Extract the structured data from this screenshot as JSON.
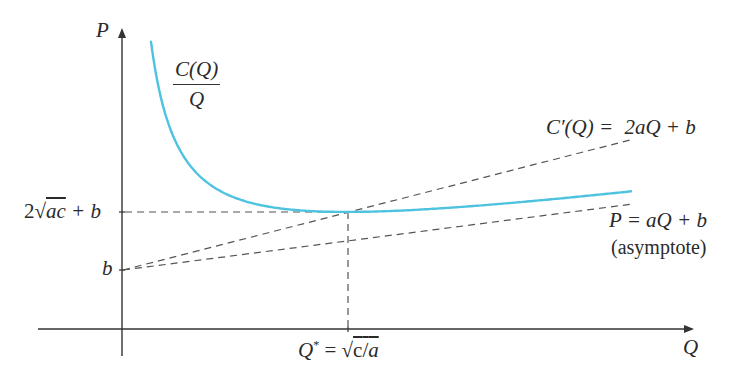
{
  "diagram": {
    "type": "economics-average-cost-curve",
    "axes": {
      "y_label": "P",
      "x_label": "Q"
    },
    "curve": {
      "name": "average-cost",
      "label_numerator": "C(Q)",
      "label_denominator": "Q",
      "color": "#4dc3e0"
    },
    "lines": {
      "marginal_cost": {
        "label_lhs": "C′(Q) =",
        "label_rhs": "2aQ + b",
        "style": "dashed"
      },
      "asymptote": {
        "label": "P = aQ + b",
        "sublabel": "(asymptote)",
        "style": "dashed"
      }
    },
    "y_ticks": {
      "min_value": {
        "prefix": "2",
        "radicand": "ac",
        "suffix": " + b"
      },
      "intercept": "b"
    },
    "x_ticks": {
      "optimum_lhs": "Q",
      "optimum_star": "*",
      "optimum_eq": " = ",
      "optimum_radical": "√",
      "optimum_radicand_c": "c",
      "optimum_slash": "/",
      "optimum_radicand_a": "a"
    },
    "colors": {
      "axis": "#333333",
      "dash": "#555555",
      "curve": "#4dc3e0"
    }
  }
}
